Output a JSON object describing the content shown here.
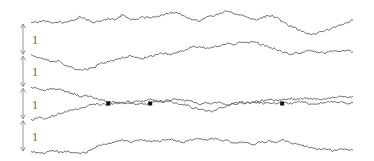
{
  "diagram": {
    "type": "coalescing-random-walks",
    "spacing_labels": [
      "1",
      "1",
      "1",
      "1"
    ],
    "paths": [
      {
        "id": "path-1",
        "start_level": 0,
        "seed": 11
      },
      {
        "id": "path-2",
        "start_level": 1,
        "seed": 23
      },
      {
        "id": "path-3",
        "start_level": 2,
        "seed": 37
      },
      {
        "id": "path-4",
        "start_level": 3,
        "seed": 41
      },
      {
        "id": "path-5",
        "start_level": 4,
        "seed": 59
      }
    ],
    "meeting_points": [
      {
        "between": [
          "path-3",
          "path-4"
        ],
        "t": 0.24
      },
      {
        "between": [
          "path-3",
          "path-4"
        ],
        "t": 0.37
      },
      {
        "between": [
          "path-3",
          "path-4"
        ],
        "t": 0.78
      }
    ],
    "colors": {
      "path": "#5a5a5a",
      "arrow": "#7a7a7a",
      "label": "#666666",
      "marker": "#111111"
    }
  }
}
